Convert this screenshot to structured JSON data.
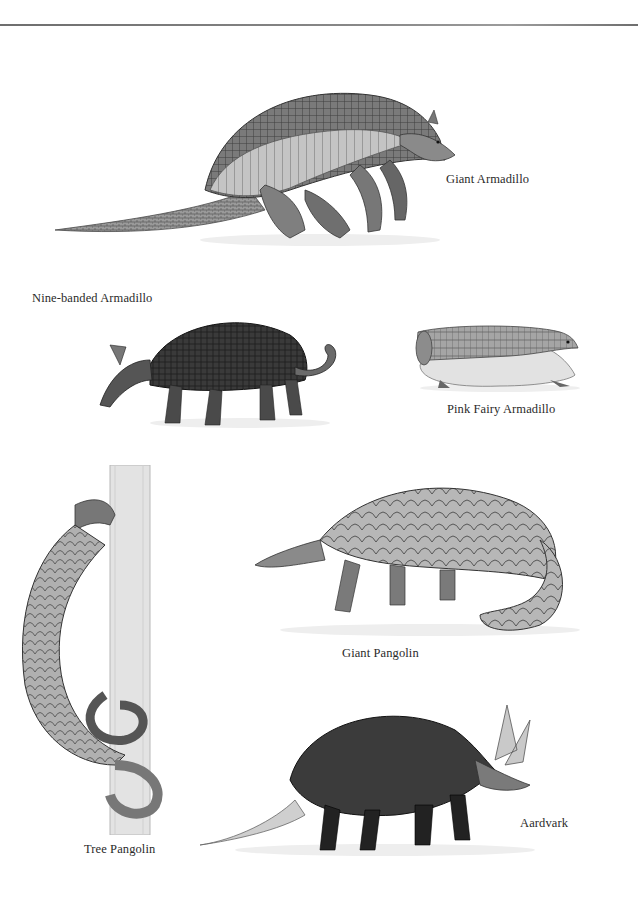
{
  "plate": {
    "labels": {
      "giant_armadillo": "Giant Armadillo",
      "nine_banded_armadillo": "Nine-banded Armadillo",
      "pink_fairy_armadillo": "Pink Fairy Armadillo",
      "giant_pangolin": "Giant Pangolin",
      "tree_pangolin": "Tree Pangolin",
      "aardvark": "Aardvark"
    },
    "colors": {
      "ink_dark": "#2a2a2a",
      "ink_mid": "#6b6b6b",
      "ink_light": "#a8a8a8",
      "shell_light": "#c9c9c9",
      "ground": "#eeeeee"
    }
  }
}
